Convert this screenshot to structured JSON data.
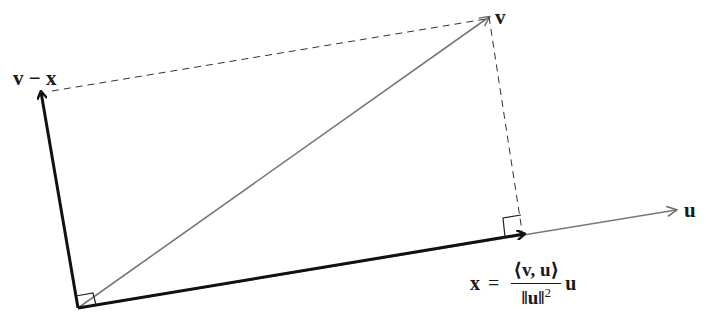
{
  "diagram": {
    "labels": {
      "v": "v",
      "u": "u",
      "v_minus_x": "v − x",
      "formula_lhs": "x",
      "formula_eq": "=",
      "formula_num": "⟨v, u⟩",
      "formula_den_norm": "‖u‖",
      "formula_den_exp": "2",
      "formula_rhs": "u"
    },
    "points": {
      "origin": [
        78,
        308
      ],
      "x_tip": [
        524,
        234
      ],
      "u_tip": [
        676,
        210
      ],
      "v_tip": [
        489,
        17
      ],
      "v_minus_x_tip": [
        41,
        92
      ]
    },
    "colors": {
      "bold_vector": "#111111",
      "thin_vector": "#777777",
      "dashed": "#333333",
      "text": "#1a1a1a"
    }
  }
}
